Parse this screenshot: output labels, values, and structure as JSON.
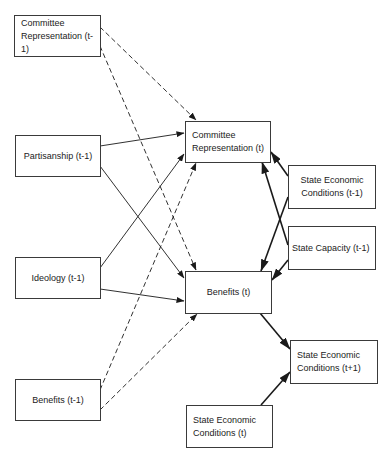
{
  "diagram": {
    "type": "path-diagram",
    "nodes": {
      "committee_rep_t1": {
        "label": "Committee\nRepresentation (t-1)"
      },
      "partisanship_t1": {
        "label": "Partisanship (t-1)"
      },
      "ideology_t1": {
        "label": "Ideology (t-1)"
      },
      "benefits_t1": {
        "label": "Benefits (t-1)"
      },
      "committee_rep_t": {
        "label": "Committee\nRepresentation (t)"
      },
      "benefits_t": {
        "label": "Benefits (t)"
      },
      "state_econ_t1": {
        "label": "State Economic\nConditions (t-1)"
      },
      "state_capacity_t1": {
        "label": "State Capacity (t-1)"
      },
      "state_econ_tplus1": {
        "label": "State Economic\nConditions (t+1)"
      },
      "state_econ_t": {
        "label": "State Economic\nConditions (t)"
      }
    },
    "edges": [
      {
        "from": "Committee Representation (t-1)",
        "to": "Committee Representation (t)",
        "style": "dashed"
      },
      {
        "from": "Committee Representation (t-1)",
        "to": "Benefits (t)",
        "style": "dashed"
      },
      {
        "from": "Partisanship (t-1)",
        "to": "Committee Representation (t)",
        "style": "solid"
      },
      {
        "from": "Partisanship (t-1)",
        "to": "Benefits (t)",
        "style": "solid"
      },
      {
        "from": "Ideology (t-1)",
        "to": "Committee Representation (t)",
        "style": "solid"
      },
      {
        "from": "Ideology (t-1)",
        "to": "Benefits (t)",
        "style": "solid"
      },
      {
        "from": "Benefits (t-1)",
        "to": "Committee Representation (t)",
        "style": "dashed"
      },
      {
        "from": "Benefits (t-1)",
        "to": "Benefits (t)",
        "style": "dashed"
      },
      {
        "from": "State Economic Conditions (t-1)",
        "to": "Committee Representation (t)",
        "style": "bold"
      },
      {
        "from": "State Economic Conditions (t-1)",
        "to": "Benefits (t)",
        "style": "bold"
      },
      {
        "from": "State Capacity (t-1)",
        "to": "Committee Representation (t)",
        "style": "bold"
      },
      {
        "from": "State Capacity (t-1)",
        "to": "Benefits (t)",
        "style": "bold"
      },
      {
        "from": "Benefits (t)",
        "to": "State Economic Conditions (t+1)",
        "style": "bold"
      },
      {
        "from": "State Economic Conditions (t)",
        "to": "State Economic Conditions (t+1)",
        "style": "bold"
      }
    ],
    "colors": {
      "line": "#1a1a1a",
      "box_border": "#3a3a3a",
      "text": "#222222",
      "background": "#ffffff"
    }
  }
}
